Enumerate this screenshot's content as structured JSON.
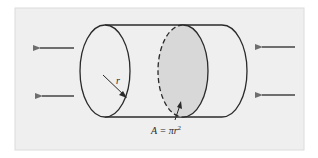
{
  "diagram": {
    "type": "cylinder-cross-section",
    "colors": {
      "background": "#ffffff",
      "panel": "#efefef",
      "outline": "#2a2a2a",
      "cross_section_fill": "#d8d8d8",
      "arrow": "#6e6e6e"
    },
    "labels": {
      "radius": "r",
      "area_prefix": "A = πr",
      "area_exponent": "2"
    },
    "arrows": [
      {
        "side": "left",
        "direction": "left",
        "position": "upper"
      },
      {
        "side": "left",
        "direction": "left",
        "position": "lower"
      },
      {
        "side": "right",
        "direction": "left",
        "position": "upper"
      },
      {
        "side": "right",
        "direction": "left",
        "position": "lower"
      }
    ]
  }
}
